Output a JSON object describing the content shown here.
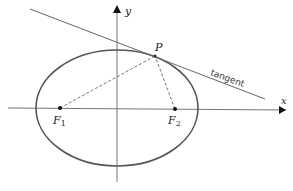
{
  "diagram": {
    "type": "ellipse-tangent",
    "labels": {
      "y_axis": "y",
      "x_axis": "x",
      "point": "P",
      "tangent": "tangent",
      "focus1": "F",
      "focus1_sub": "1",
      "focus2": "F",
      "focus2_sub": "2"
    },
    "colors": {
      "ellipse": "#555555",
      "line": "#555555",
      "dashed": "#666666",
      "point": "#111111"
    }
  }
}
